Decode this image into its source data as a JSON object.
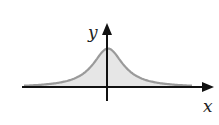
{
  "figure": {
    "axes": {
      "x_label": "x",
      "y_label": "y"
    },
    "colors": {
      "background": "#ffffff",
      "axis": "#111111",
      "curve": "#9a9a9a",
      "fill": "#e6e6e6",
      "label": "#222222"
    },
    "curve": {
      "type": "cauchy-like bell",
      "center_x": 0,
      "peak_height": 1,
      "x_range": [
        -4,
        4
      ],
      "shaded_under_curve": true
    }
  }
}
